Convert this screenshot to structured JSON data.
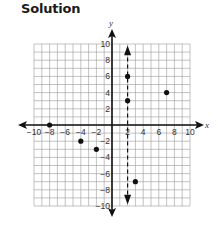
{
  "title": "Solution",
  "chart_data": {
    "type": "scatter",
    "title": "Solution",
    "xlabel": "x",
    "ylabel": "y",
    "xlim": [
      -10,
      10
    ],
    "ylim": [
      -10,
      10
    ],
    "grid": true,
    "x_ticks": [
      -10,
      -8,
      -6,
      -4,
      -2,
      2,
      4,
      6,
      8,
      10
    ],
    "y_ticks": [
      10,
      8,
      6,
      4,
      2,
      -2,
      -4,
      -6,
      -8,
      -10
    ],
    "series": [
      {
        "name": "points",
        "points": [
          {
            "x": -8,
            "y": 0
          },
          {
            "x": -4,
            "y": -2
          },
          {
            "x": -2,
            "y": -3
          },
          {
            "x": 2,
            "y": 6
          },
          {
            "x": 2,
            "y": 3
          },
          {
            "x": 3,
            "y": -7
          },
          {
            "x": 7,
            "y": 4
          }
        ]
      }
    ],
    "annotations": [
      {
        "type": "dashed-vertical-line",
        "x": 2,
        "arrows": "both"
      }
    ]
  }
}
